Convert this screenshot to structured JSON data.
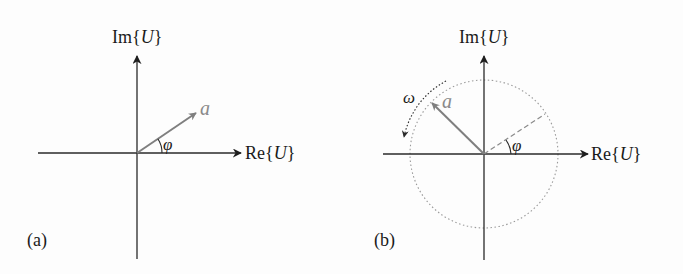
{
  "panels": [
    {
      "id": "a",
      "caption": "(a)",
      "axis_x_label_prefix": "Re",
      "axis_y_label_prefix": "Im",
      "axis_variable": "U",
      "vector_label": "a",
      "angle_label": "φ",
      "description": "Phasor a drawn at angle φ from the real axis in the complex plane"
    },
    {
      "id": "b",
      "caption": "(b)",
      "axis_x_label_prefix": "Re",
      "axis_y_label_prefix": "Im",
      "axis_variable": "U",
      "vector_label": "a",
      "angle_label": "φ",
      "rotation_label": "ω",
      "description": "Phasor a rotating counter-clockwise with angular frequency ω on a dotted circle; dashed line marks initial angle φ"
    }
  ],
  "colors": {
    "axis": "#2a2a2a",
    "vector": "#7f7f7f",
    "circle": "#9a9a9a",
    "text": "#1a1a1a"
  }
}
